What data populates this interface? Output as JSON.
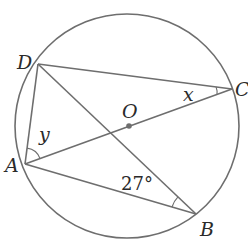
{
  "figure": {
    "type": "circle-geometry",
    "circle": {
      "center_label": "O",
      "cx": 127,
      "cy": 126,
      "r": 112
    },
    "points": {
      "A": {
        "label": "A",
        "x": 25,
        "y": 164
      },
      "B": {
        "label": "B",
        "x": 196,
        "y": 214
      },
      "C": {
        "label": "C",
        "x": 232,
        "y": 89
      },
      "D": {
        "label": "D",
        "x": 38,
        "y": 64
      },
      "O": {
        "label": "O",
        "x": 129,
        "y": 126
      }
    },
    "segments": [
      "DC",
      "DB",
      "DA",
      "AC",
      "AB"
    ],
    "angles": {
      "x": {
        "label": "x",
        "vertex": "C",
        "between": [
          "CD",
          "CA"
        ]
      },
      "y": {
        "label": "y",
        "vertex": "A",
        "between": [
          "AD",
          "AC"
        ]
      },
      "abd": {
        "label": "27°",
        "vertex": "B",
        "between": [
          "BA",
          "BD"
        ],
        "value_deg": 27
      }
    },
    "colors": {
      "line": "#6e6e6e",
      "text": "#2a2a2a",
      "background": "#ffffff"
    }
  }
}
